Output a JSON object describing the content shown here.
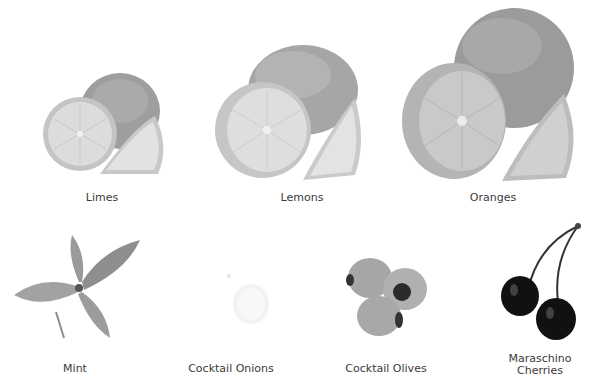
{
  "garnishes": [
    {
      "name": "Limes"
    },
    {
      "name": "Lemons"
    },
    {
      "name": "Oranges"
    },
    {
      "name": "Mint"
    },
    {
      "name": "Cocktail Onions"
    },
    {
      "name": "Cocktail Olives"
    },
    {
      "name": "Maraschino",
      "name_line2": "Cherries"
    }
  ],
  "colors": {
    "background": "#ffffff",
    "label_text": "#3a3a3a",
    "fruit_gray": "#b0b0b0",
    "cherry_dark": "#111111"
  }
}
